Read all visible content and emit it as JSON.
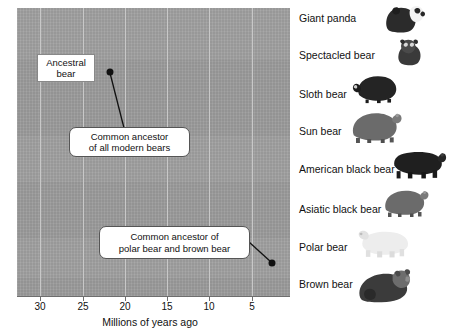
{
  "figure": {
    "type": "phylogenetic-tree-diagram",
    "background_color": "#ffffff",
    "plot_fill_color": "#9c9c9c",
    "gridline_color": "#c8c8c8"
  },
  "axis": {
    "title": "Millions of years ago",
    "tick_labels": [
      "30",
      "25",
      "20",
      "15",
      "10",
      "5"
    ],
    "tick_values": [
      30,
      25,
      20,
      15,
      10,
      5
    ],
    "tick_x_px": [
      40,
      83,
      125,
      167,
      209,
      252
    ],
    "direction": "decreasing-left-to-right"
  },
  "callouts": [
    {
      "id": "ancestral-bear",
      "text": "Ancestral\nbear",
      "style": "sharp",
      "x": 37,
      "y": 54,
      "w": 58,
      "h": 28
    },
    {
      "id": "common-ancestor-all",
      "text": "Common ancestor\nof all modern bears",
      "style": "round",
      "x": 69,
      "y": 127,
      "w": 121,
      "h": 30
    },
    {
      "id": "common-ancestor-polar-brown",
      "text": "Common ancestor of\npolar bear and brown bear",
      "style": "round",
      "x": 99,
      "y": 226,
      "w": 151,
      "h": 33
    }
  ],
  "nodes": [
    {
      "id": "root-node",
      "label": "common ancestor of all modern bears",
      "x": 110,
      "y": 72
    },
    {
      "id": "polar-brown-node",
      "label": "common ancestor of polar bear and brown bear",
      "x": 272,
      "y": 263
    }
  ],
  "taxa": [
    {
      "name": "Giant panda",
      "label_x": 299,
      "label_y": 12,
      "img_x": 379,
      "img_y": 2,
      "img_w": 52,
      "img_h": 32,
      "shape": "panda"
    },
    {
      "name": "Spectacled bear",
      "label_x": 299,
      "label_y": 49,
      "img_x": 388,
      "img_y": 35,
      "img_w": 44,
      "img_h": 34,
      "shape": "sitting"
    },
    {
      "name": "Sloth bear",
      "label_x": 299,
      "label_y": 88,
      "img_x": 351,
      "img_y": 70,
      "img_w": 52,
      "img_h": 34,
      "shape": "sloth"
    },
    {
      "name": "Sun bear",
      "label_x": 299,
      "label_y": 125,
      "img_x": 345,
      "img_y": 107,
      "img_w": 58,
      "img_h": 36,
      "shape": "standing"
    },
    {
      "name": "American black bear",
      "label_x": 299,
      "label_y": 163,
      "img_x": 387,
      "img_y": 143,
      "img_w": 62,
      "img_h": 36,
      "shape": "walking"
    },
    {
      "name": "Asiatic black bear",
      "label_x": 299,
      "label_y": 203,
      "img_x": 379,
      "img_y": 183,
      "img_w": 50,
      "img_h": 36,
      "shape": "standing"
    },
    {
      "name": "Polar bear",
      "label_x": 299,
      "label_y": 241,
      "img_x": 356,
      "img_y": 222,
      "img_w": 58,
      "img_h": 36,
      "shape": "polar"
    },
    {
      "name": "Brown bear",
      "label_x": 299,
      "label_y": 278,
      "img_x": 353,
      "img_y": 262,
      "img_w": 60,
      "img_h": 44,
      "shape": "brown"
    }
  ]
}
